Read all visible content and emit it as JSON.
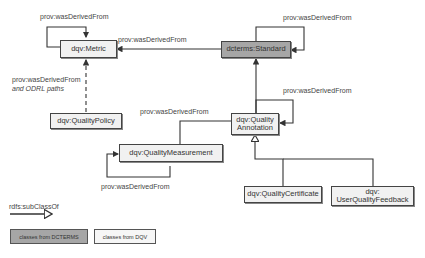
{
  "diagram": {
    "nodes": {
      "metric": {
        "label": "dqv:Metric",
        "type": "dqv"
      },
      "standard": {
        "label": "dcterms:Standard",
        "type": "dcterms"
      },
      "quality_policy": {
        "label": "dqv:QualityPolicy",
        "type": "dqv"
      },
      "quality_annotation": {
        "label": "dqv:Quality Annotation",
        "line1": "dqv:Quality",
        "line2": "Annotation",
        "type": "dqv"
      },
      "quality_measurement": {
        "label": "dqv:QualityMeasurement",
        "type": "dqv"
      },
      "quality_certificate": {
        "label": "dqv:QualityCertificate",
        "type": "dqv"
      },
      "user_quality_feedback": {
        "label": "dqv: UserQualityFeedback",
        "line1": "dqv:",
        "line2": "UserQualityFeedback",
        "type": "dqv"
      }
    },
    "edge_labels": {
      "metric_self": "prov:wasDerivedFrom",
      "standard_to_metric": "prov:wasDerivedFrom",
      "standard_self": "prov:wasDerivedFrom",
      "policy_to_metric_line1": "prov:wasDerivedFrom",
      "policy_to_metric_line2": "and ODRL paths",
      "annotation_to_measurement": "prov:wasDerivedFrom",
      "annotation_self": "prov:wasDerivedFrom",
      "measurement_self": "prov:wasDerivedFrom"
    },
    "edges": [
      {
        "from": "metric",
        "to": "metric",
        "label": "prov:wasDerivedFrom"
      },
      {
        "from": "standard",
        "to": "metric",
        "label": "prov:wasDerivedFrom"
      },
      {
        "from": "standard",
        "to": "standard",
        "label": "prov:wasDerivedFrom"
      },
      {
        "from": "quality_policy",
        "to": "metric",
        "label": "prov:wasDerivedFrom and ODRL paths",
        "style": "dashed"
      },
      {
        "from": "quality_annotation",
        "to": "standard",
        "label": ""
      },
      {
        "from": "quality_annotation",
        "to": "quality_annotation",
        "label": "prov:wasDerivedFrom"
      },
      {
        "from": "quality_annotation",
        "to": "quality_measurement",
        "label": "prov:wasDerivedFrom"
      },
      {
        "from": "quality_measurement",
        "to": "quality_measurement",
        "label": "prov:wasDerivedFrom"
      },
      {
        "from": "quality_certificate",
        "to": "quality_annotation",
        "label": "rdfs:subClassOf"
      },
      {
        "from": "user_quality_feedback",
        "to": "quality_annotation",
        "label": "rdfs:subClassOf"
      }
    ]
  },
  "legend": {
    "subclass_label": "rdfs:subClassOf",
    "dcterms_label": "classes from DCTERMS",
    "dqv_label": "classes from DQV"
  },
  "colors": {
    "dcterms_fill": "#a6a6a6",
    "dqv_fill": "#f1f1f1",
    "stroke": "#444444"
  }
}
